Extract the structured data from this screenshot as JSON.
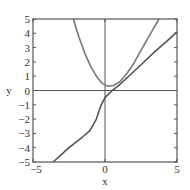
{
  "chart_data": {
    "type": "line",
    "title": "",
    "xlabel": "x",
    "ylabel": "y",
    "xlim": [
      -5,
      5
    ],
    "ylim": [
      -5,
      5
    ],
    "grid": false,
    "zero_lines": true,
    "x_ticks": [
      -5,
      0,
      5
    ],
    "x_tick_labels": [
      "−5",
      "0",
      "5"
    ],
    "y_ticks": [
      -5,
      -4,
      -3,
      -2,
      -1,
      0,
      1,
      2,
      3,
      4,
      5
    ],
    "y_tick_labels": [
      "−5",
      "−4",
      "−3",
      "−2",
      "−1",
      "0",
      "1",
      "2",
      "3",
      "4",
      "5"
    ],
    "series": [
      {
        "name": "parabola",
        "color": "#777777",
        "points": [
          [
            -2.2,
            5.0
          ],
          [
            -1.8,
            3.7
          ],
          [
            -1.4,
            2.6
          ],
          [
            -1.0,
            1.7
          ],
          [
            -0.6,
            1.0
          ],
          [
            -0.2,
            0.5
          ],
          [
            0.2,
            0.3
          ],
          [
            0.6,
            0.35
          ],
          [
            1.0,
            0.6
          ],
          [
            1.5,
            1.15
          ],
          [
            2.0,
            1.9
          ],
          [
            2.5,
            2.8
          ],
          [
            3.0,
            3.7
          ],
          [
            3.4,
            4.4
          ],
          [
            3.75,
            5.0
          ]
        ]
      },
      {
        "name": "lower-curve",
        "color": "#555555",
        "points": [
          [
            -3.6,
            -5.0
          ],
          [
            -2.5,
            -4.0
          ],
          [
            -1.5,
            -3.2
          ],
          [
            -1.05,
            -2.8
          ],
          [
            -0.6,
            -2.0
          ],
          [
            -0.3,
            -1.1
          ],
          [
            0.0,
            -0.5
          ],
          [
            0.5,
            0.0
          ],
          [
            0.9,
            0.3
          ],
          [
            1.7,
            1.05
          ],
          [
            2.5,
            1.8
          ],
          [
            3.5,
            2.75
          ],
          [
            4.3,
            3.45
          ],
          [
            5.0,
            4.1
          ]
        ]
      }
    ]
  }
}
